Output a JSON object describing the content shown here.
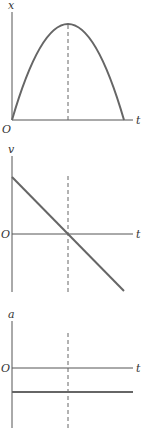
{
  "figure": {
    "panels": [
      {
        "name": "position-time",
        "y_label": "x",
        "x_label": "t",
        "origin_label": "O",
        "shape": "downward parabola, peak at dashed line"
      },
      {
        "name": "velocity-time",
        "y_label": "v",
        "x_label": "t",
        "origin_label": "O",
        "shape": "straight line with negative slope, crossing zero at dashed line"
      },
      {
        "name": "acceleration-time",
        "y_label": "a",
        "x_label": "t",
        "origin_label": "O",
        "shape": "constant negative horizontal line"
      }
    ],
    "caption_cutoff": ""
  },
  "colors": {
    "axis": "#555555",
    "curve": "#666666",
    "background": "#ffffff"
  }
}
